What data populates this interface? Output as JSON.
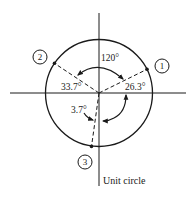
{
  "diagram": {
    "type": "unit-circle-phasor",
    "colors": {
      "ink": "#1a1a1a",
      "background": "#ffffff"
    },
    "caption": "Unit circle",
    "points": [
      {
        "id": "1",
        "label": "1",
        "angle_from_positive_x_deg": 26.3
      },
      {
        "id": "2",
        "label": "2",
        "angle_from_positive_x_deg": 146.3
      },
      {
        "id": "3",
        "label": "3",
        "angle_from_positive_x_deg": 266.3
      }
    ],
    "angle_labels": {
      "between_1_and_2": "120°",
      "point_1_above_x": "26.3°",
      "point_2_above_negative_x": "33.7°",
      "point_3_from_negative_y": "3.7°"
    }
  }
}
